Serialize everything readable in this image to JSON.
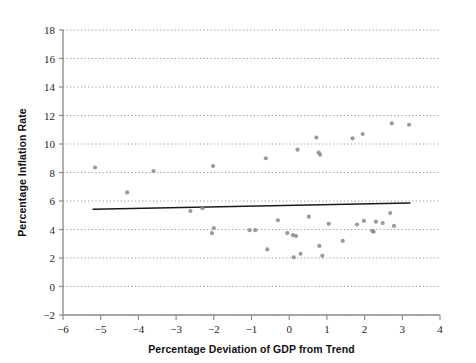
{
  "chart_data": {
    "type": "scatter",
    "title": "",
    "xlabel": "Percentage Deviation of GDP from Trend",
    "ylabel": "Percentage Inflation Rate",
    "xlim": [
      -6,
      4
    ],
    "ylim": [
      -2,
      18
    ],
    "xticks": [
      -6,
      -5,
      -4,
      -3,
      -2,
      -1,
      0,
      1,
      2,
      3,
      4
    ],
    "xtick_labels": [
      "−6",
      "−5",
      "−4",
      "−3",
      "−2",
      "−1",
      "0",
      "1",
      "2",
      "3",
      "4"
    ],
    "yticks": [
      -2,
      0,
      2,
      4,
      6,
      8,
      10,
      12,
      14,
      16,
      18
    ],
    "ytick_labels": [
      "−2",
      "0",
      "2",
      "4",
      "6",
      "8",
      "10",
      "12",
      "14",
      "16",
      "18"
    ],
    "grid": "horizontal-dotted",
    "legend": "none",
    "marker_color": "#8a8a8a",
    "line_color": "#1a1a1a",
    "axis_color": "#8d8d8d",
    "grid_color": "#9a9a9a",
    "points": [
      [
        -5.15,
        8.35
      ],
      [
        -4.3,
        6.6
      ],
      [
        -3.6,
        8.1
      ],
      [
        -2.62,
        5.3
      ],
      [
        -2.3,
        5.5
      ],
      [
        -2.02,
        8.45
      ],
      [
        -2.0,
        4.1
      ],
      [
        -2.05,
        3.75
      ],
      [
        -1.05,
        3.95
      ],
      [
        -0.9,
        3.95
      ],
      [
        -0.62,
        9.0
      ],
      [
        -0.58,
        2.6
      ],
      [
        -0.3,
        4.65
      ],
      [
        -0.05,
        3.75
      ],
      [
        0.1,
        3.6
      ],
      [
        0.12,
        2.05
      ],
      [
        0.18,
        3.55
      ],
      [
        0.22,
        9.6
      ],
      [
        0.3,
        2.3
      ],
      [
        0.52,
        4.9
      ],
      [
        0.72,
        10.45
      ],
      [
        0.78,
        9.4
      ],
      [
        0.82,
        9.25
      ],
      [
        0.8,
        2.85
      ],
      [
        0.88,
        2.15
      ],
      [
        1.05,
        4.4
      ],
      [
        1.42,
        3.2
      ],
      [
        1.68,
        10.4
      ],
      [
        1.8,
        4.35
      ],
      [
        1.95,
        10.7
      ],
      [
        1.98,
        4.6
      ],
      [
        2.2,
        3.9
      ],
      [
        2.24,
        3.85
      ],
      [
        2.3,
        4.55
      ],
      [
        2.48,
        4.45
      ],
      [
        2.68,
        5.15
      ],
      [
        2.72,
        11.45
      ],
      [
        2.78,
        4.25
      ],
      [
        3.18,
        11.35
      ]
    ],
    "trend_line": {
      "label": "fitted regression line",
      "x_start": -5.2,
      "y_start": 5.42,
      "x_end": 3.2,
      "y_end": 5.86
    }
  }
}
